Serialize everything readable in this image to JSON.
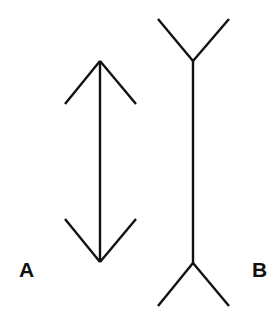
{
  "figure": {
    "stroke_color": "#111111",
    "background": "#ffffff",
    "stroke_width": 2.4
  },
  "figures": [
    {
      "label": "A",
      "fin_style": "inward-arrowheads",
      "shaft": {
        "x1": 100,
        "y1": 61,
        "x2": 100,
        "y2": 262
      },
      "fins": [
        {
          "x1": 100,
          "y1": 61,
          "x2": 65,
          "y2": 104
        },
        {
          "x1": 100,
          "y1": 61,
          "x2": 136,
          "y2": 104
        },
        {
          "x1": 100,
          "y1": 262,
          "x2": 65,
          "y2": 219
        },
        {
          "x1": 100,
          "y1": 262,
          "x2": 136,
          "y2": 219
        }
      ]
    },
    {
      "label": "B",
      "fin_style": "outward-tails",
      "shaft": {
        "x1": 193,
        "y1": 61,
        "x2": 193,
        "y2": 263
      },
      "fins": [
        {
          "x1": 193,
          "y1": 61,
          "x2": 158,
          "y2": 19
        },
        {
          "x1": 193,
          "y1": 61,
          "x2": 229,
          "y2": 19
        },
        {
          "x1": 193,
          "y1": 263,
          "x2": 158,
          "y2": 306
        },
        {
          "x1": 193,
          "y1": 263,
          "x2": 229,
          "y2": 306
        }
      ]
    }
  ]
}
